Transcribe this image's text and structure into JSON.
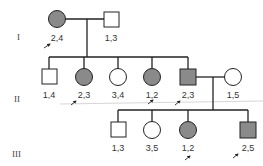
{
  "colors": {
    "affected": "#8a8a8a",
    "unaffected": "#ffffff",
    "line": "#222222"
  },
  "generations": [
    {
      "label": "I"
    },
    {
      "label": "II"
    },
    {
      "label": "III"
    }
  ],
  "individuals": [
    {
      "gen": "I",
      "sex": "female",
      "affected": true,
      "genotype": "2,4",
      "proband_arrow": true
    },
    {
      "gen": "I",
      "sex": "male",
      "affected": false,
      "genotype": "1,3",
      "proband_arrow": false
    },
    {
      "gen": "II",
      "sex": "male",
      "affected": false,
      "genotype": "1,4",
      "proband_arrow": false
    },
    {
      "gen": "II",
      "sex": "female",
      "affected": true,
      "genotype": "2,3",
      "proband_arrow": true
    },
    {
      "gen": "II",
      "sex": "female",
      "affected": false,
      "genotype": "3,4",
      "proband_arrow": false
    },
    {
      "gen": "II",
      "sex": "female",
      "affected": true,
      "genotype": "1,2",
      "proband_arrow": true
    },
    {
      "gen": "II",
      "sex": "male",
      "affected": true,
      "genotype": "2,3",
      "proband_arrow": true
    },
    {
      "gen": "II",
      "sex": "female",
      "affected": false,
      "genotype": "1,5",
      "proband_arrow": false
    },
    {
      "gen": "III",
      "sex": "male",
      "affected": false,
      "genotype": "1,3",
      "proband_arrow": false
    },
    {
      "gen": "III",
      "sex": "female",
      "affected": false,
      "genotype": "3,5",
      "proband_arrow": false
    },
    {
      "gen": "III",
      "sex": "female",
      "affected": true,
      "genotype": "1,2",
      "proband_arrow": true
    },
    {
      "gen": "III",
      "sex": "male",
      "affected": true,
      "genotype": "2,5",
      "proband_arrow": true
    }
  ]
}
